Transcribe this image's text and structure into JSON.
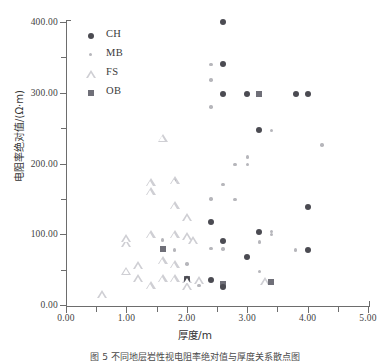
{
  "chart_data": {
    "type": "scatter",
    "title": "",
    "xlabel": "厚度/m",
    "ylabel": "电阻率绝对值/(Ω·m)",
    "xlim": [
      0.0,
      5.0
    ],
    "ylim": [
      0.0,
      400.0
    ],
    "xticks": [
      "0.00",
      "1.00",
      "2.00",
      "3.00",
      "4.00",
      "5.00"
    ],
    "yticks": [
      "0.00",
      "100.00",
      "200.00",
      "300.00",
      "400.00"
    ],
    "xtick_values": [
      0,
      1,
      2,
      3,
      4,
      5
    ],
    "ytick_values": [
      0,
      100,
      200,
      300,
      400
    ],
    "minor_yticks": [
      50,
      150,
      250,
      350
    ],
    "grid": false,
    "legend_position": "upper-left-inside",
    "legend": [
      "CH",
      "MB",
      "FS",
      "OB"
    ],
    "colors": {
      "CH": "#4b4b52",
      "MB": "#b6b6bb",
      "FS": "#cfcfd4",
      "OB": "#6f6f78",
      "axis": "#6d6d6d",
      "text": "#3a3a3a"
    },
    "markers": {
      "CH": "filled-circle",
      "MB": "small-dot",
      "FS": "open-triangle",
      "OB": "filled-square"
    },
    "series": [
      {
        "name": "CH",
        "marker": "filled-circle",
        "color": "#4b4b52",
        "points": [
          [
            2.6,
            400
          ],
          [
            2.6,
            340
          ],
          [
            2.6,
            298
          ],
          [
            3.0,
            298
          ],
          [
            3.8,
            298
          ],
          [
            4.0,
            298
          ],
          [
            3.2,
            247
          ],
          [
            4.0,
            138
          ],
          [
            2.4,
            118
          ],
          [
            3.2,
            103
          ],
          [
            2.6,
            90
          ],
          [
            3.0,
            68
          ],
          [
            4.0,
            78
          ],
          [
            2.4,
            36
          ],
          [
            2.0,
            37
          ],
          [
            2.6,
            25
          ]
        ]
      },
      {
        "name": "MB",
        "marker": "small-dot",
        "color": "#b6b6bb",
        "points": [
          [
            2.4,
            340
          ],
          [
            2.4,
            318
          ],
          [
            2.4,
            280
          ],
          [
            3.4,
            247
          ],
          [
            4.24,
            226
          ],
          [
            3.0,
            209
          ],
          [
            2.8,
            199
          ],
          [
            3.0,
            199
          ],
          [
            2.6,
            170
          ],
          [
            1.8,
            176
          ],
          [
            2.4,
            150
          ],
          [
            2.8,
            149
          ],
          [
            3.4,
            100
          ],
          [
            3.4,
            104
          ],
          [
            3.2,
            89
          ],
          [
            1.6,
            92
          ],
          [
            1.8,
            78
          ],
          [
            2.4,
            80
          ],
          [
            2.6,
            79
          ],
          [
            3.8,
            78
          ],
          [
            2.0,
            58
          ],
          [
            3.2,
            47
          ],
          [
            2.2,
            28
          ]
        ]
      },
      {
        "name": "FS",
        "marker": "open-triangle",
        "color": "#cfcfd4",
        "points": [
          [
            1.6,
            236
          ],
          [
            1.8,
            176
          ],
          [
            1.4,
            173
          ],
          [
            1.4,
            160
          ],
          [
            1.8,
            140
          ],
          [
            2.0,
            123
          ],
          [
            1.0,
            94
          ],
          [
            1.0,
            87
          ],
          [
            1.4,
            99
          ],
          [
            1.8,
            99
          ],
          [
            2.0,
            97
          ],
          [
            2.1,
            91
          ],
          [
            1.6,
            63
          ],
          [
            1.8,
            57
          ],
          [
            1.2,
            56
          ],
          [
            1.0,
            48
          ],
          [
            1.2,
            38
          ],
          [
            1.6,
            37
          ],
          [
            1.8,
            37
          ],
          [
            2.0,
            36
          ],
          [
            2.2,
            35
          ],
          [
            1.4,
            27
          ],
          [
            2.0,
            26
          ],
          [
            0.6,
            15
          ],
          [
            3.3,
            33
          ]
        ]
      },
      {
        "name": "OB",
        "marker": "filled-square",
        "color": "#6f6f78",
        "points": [
          [
            3.2,
            298
          ],
          [
            1.6,
            79
          ],
          [
            2.0,
            37
          ],
          [
            2.6,
            29
          ],
          [
            3.4,
            33
          ]
        ]
      }
    ]
  },
  "figure": {
    "caption": "图 5  不同地层岩性视电阻率绝对值与厚度关系散点图"
  }
}
